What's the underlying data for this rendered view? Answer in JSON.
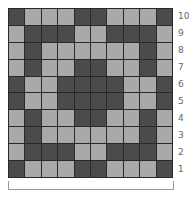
{
  "chart": {
    "rows_count": 10,
    "cols_count": 10,
    "colors": {
      "dark": "#4b4b4b",
      "light": "#a9a9a9",
      "gridline": "#2a2a2a"
    },
    "row_labels": [
      "10",
      "9",
      "8",
      "7",
      "6",
      "5",
      "4",
      "3",
      "2",
      "1"
    ],
    "pattern_top_to_bottom": [
      "DLLLDDLLLD",
      "LDDDLLDDDL",
      "LDLLLLLLDL",
      "LDLLDDLLDL",
      "DLLDDDDLLD",
      "DLLDDDDLLD",
      "LDLLDDLLDL",
      "LDLLLLLLDL",
      "LDDDLLDDDL",
      "DLLLDDLLLD"
    ],
    "bracket_label": ""
  }
}
